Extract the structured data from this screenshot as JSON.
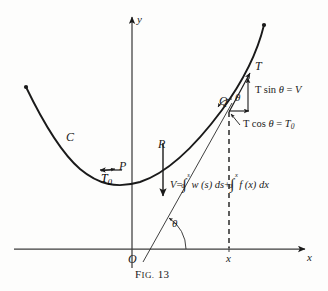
{
  "figure": {
    "caption_prefix": "F",
    "caption_rest": "IG.",
    "caption_number": "13",
    "caption_full": "FIG. 13"
  },
  "axes": {
    "y_label": "y",
    "x_label": "x",
    "origin_label": "O",
    "x_tick_label": "x"
  },
  "curve": {
    "label": "C"
  },
  "points": {
    "P": "P",
    "Q": "Q",
    "R": "R",
    "T": "T"
  },
  "angles": {
    "theta_at_origin": "θ",
    "theta_at_Q": "θ"
  },
  "vectors": {
    "T0": "T",
    "T0_sub": "0"
  },
  "force_components": {
    "vertical": {
      "fn": "T sin ",
      "theta": "θ",
      "eq": " = ",
      "result": "V"
    },
    "horizontal": {
      "fn": "T cos ",
      "theta": "θ",
      "eq": " = ",
      "result": "T",
      "result_sub": "0"
    }
  },
  "equation": {
    "lhs": "V",
    "eq": "=",
    "int1": {
      "sym": "∫",
      "lower": "0",
      "upper": "s",
      "body": "w (s) ds"
    },
    "plus": "+",
    "int2": {
      "sym": "∫",
      "lower": "0",
      "upper": "x",
      "body": "f (x) dx"
    },
    "full": "V = ∫₀ˢ w(s) ds + ∫₀ˣ f(x) dx"
  },
  "colors": {
    "ink": "#1a1a1a",
    "paper": "#fdfdfc",
    "axis": "#4a4a4a"
  }
}
